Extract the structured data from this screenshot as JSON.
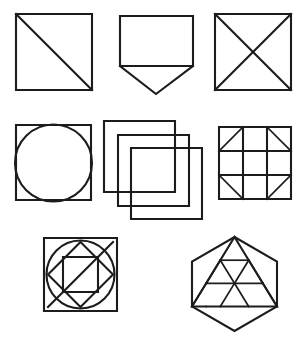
{
  "sheet": {
    "title": "Geometric line figure set",
    "background_color": "#ffffff",
    "stroke_color": "#1c1c1c",
    "width": 307,
    "height": 339,
    "figure_count": 8,
    "row_layout": [
      3,
      3,
      2
    ]
  },
  "figures": [
    {
      "id": "figure-1",
      "name": "square-with-diagonal",
      "label": "Square with single diagonal",
      "row": 1,
      "column": 1,
      "box": {
        "x": 16,
        "y": 14,
        "w": 76,
        "h": 76
      },
      "elements": [
        "square",
        "diagonal top-left to bottom-right"
      ]
    },
    {
      "id": "figure-2",
      "name": "rectangle-with-triangle-below",
      "label": "Rectangle with downward triangle below",
      "row": 1,
      "column": 2,
      "box": {
        "x": 120,
        "y": 16,
        "w": 73,
        "h": 78
      },
      "elements": [
        "rectangle",
        "downward pointing triangle on bottom edge"
      ]
    },
    {
      "id": "figure-3",
      "name": "square-with-both-diagonals",
      "label": "Square with both diagonals forming an X",
      "row": 1,
      "column": 3,
      "box": {
        "x": 215,
        "y": 14,
        "w": 76,
        "h": 76
      },
      "elements": [
        "square",
        "diagonal top-left to bottom-right",
        "diagonal top-right to bottom-left"
      ]
    },
    {
      "id": "figure-4",
      "name": "square-with-inscribed-circle",
      "label": "Square with inscribed circle",
      "row": 2,
      "column": 1,
      "box": {
        "x": 16,
        "y": 125,
        "w": 75,
        "h": 75
      },
      "elements": [
        "square",
        "inscribed circle"
      ]
    },
    {
      "id": "figure-5",
      "name": "three-overlapping-squares",
      "label": "Three overlapping offset squares",
      "row": 2,
      "column": 2,
      "box": {
        "x": 104,
        "y": 121,
        "w": 98,
        "h": 99
      },
      "elements": [
        "square back",
        "square middle",
        "square front"
      ],
      "offset_step": 17
    },
    {
      "id": "figure-6",
      "name": "three-by-three-grid-with-corner-diagonals",
      "label": "3x3 grid with diagonals in the four corner cells",
      "row": 2,
      "column": 3,
      "box": {
        "x": 219,
        "y": 127,
        "w": 72,
        "h": 72
      },
      "grid": {
        "rows": 3,
        "columns": 3
      },
      "corner_diagonals": {
        "top_left": "/",
        "top_right": "\\",
        "bottom_left": "\\",
        "bottom_right": "/"
      }
    },
    {
      "id": "figure-7",
      "name": "nested-square-circle-diamond",
      "label": "Square with circle, rotated diamond, inner square and a diagonal",
      "row": 3,
      "column": 1,
      "box": {
        "x": 44,
        "y": 238,
        "w": 73,
        "h": 73
      },
      "elements": [
        "outer square",
        "inscribed circle",
        "rotated square diamond",
        "inner square",
        "diagonal bottom-left to top-right"
      ]
    },
    {
      "id": "figure-8",
      "name": "hexagon-with-subdivided-triangle",
      "label": "Hexagon containing a triangle subdivided into nine small triangles",
      "row": 3,
      "column": 2,
      "box": {
        "x": 192,
        "y": 237,
        "w": 85,
        "h": 94
      },
      "elements": [
        "hexagon",
        "inscribed triangle",
        "triangular subdivision"
      ],
      "subdivision_rows": 3,
      "small_triangle_count": 9
    }
  ]
}
